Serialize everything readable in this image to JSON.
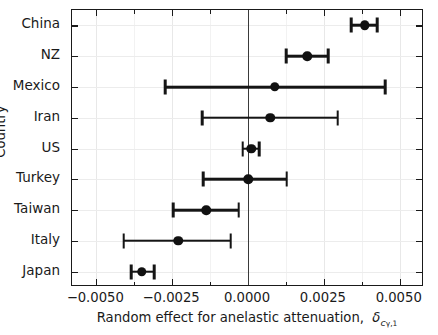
{
  "chart_data": {
    "type": "scatter",
    "title": "",
    "xlabel": "Random effect for anelastic attenuation,  δcγ,1",
    "xlabel_plain": "Random effect for anelastic attenuation, delta_c_gamma,1",
    "ylabel": "Country",
    "xlim": [
      -0.0058,
      0.0058
    ],
    "xticks": [
      -0.005,
      -0.0025,
      0.0,
      0.0025,
      0.005
    ],
    "xticklabels": [
      "−0.0050",
      "−0.0025",
      "0.0000",
      "0.0025",
      "0.0050"
    ],
    "xminorticks": [
      -0.00375,
      -0.00125,
      0.00125,
      0.00375
    ],
    "grid": true,
    "legend": false,
    "reference_line": 0.0,
    "categories": [
      "China",
      "NZ",
      "Mexico",
      "Iran",
      "US",
      "Turkey",
      "Taiwan",
      "Italy",
      "Japan"
    ],
    "series": [
      {
        "name": "Random effect estimate with 95% interval",
        "marker": "filled-circle",
        "color": "#111111",
        "points": [
          {
            "category": "China",
            "value": 0.00385,
            "low": 0.00341,
            "high": 0.00425
          },
          {
            "category": "NZ",
            "value": 0.00196,
            "low": 0.00125,
            "high": 0.00264
          },
          {
            "category": "Mexico",
            "value": 0.00088,
            "low": -0.00273,
            "high": 0.00452
          },
          {
            "category": "Iran",
            "value": 0.00074,
            "low": -0.00151,
            "high": 0.00296
          },
          {
            "category": "US",
            "value": 0.0001,
            "low": -0.00017,
            "high": 0.00037
          },
          {
            "category": "Turkey",
            "value": 0.0,
            "low": -0.00148,
            "high": 0.00128
          },
          {
            "category": "Taiwan",
            "value": -0.00137,
            "low": -0.00247,
            "high": -0.00031
          },
          {
            "category": "Italy",
            "value": -0.0023,
            "low": -0.00409,
            "high": -0.00057
          },
          {
            "category": "Japan",
            "value": -0.0035,
            "low": -0.00384,
            "high": -0.0031
          }
        ]
      }
    ]
  },
  "axes": {
    "x_title_prefix": "Random effect for anelastic attenuation,",
    "x_title_symbol": "δ",
    "x_title_sub_c": "c",
    "x_title_sub_gamma": "γ",
    "x_title_sub_one": ",1",
    "y_title": "Country"
  },
  "colors": {
    "marker": "#111111",
    "whisker": "#151515",
    "axis": "#1a1a1a",
    "grid": "#e8e8e8",
    "zero_line": "#3a3a3a",
    "background": "#ffffff"
  }
}
